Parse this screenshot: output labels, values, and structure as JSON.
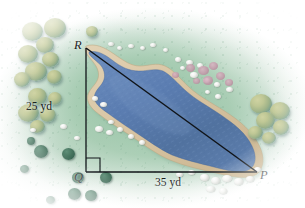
{
  "figure": {
    "type": "geometry-illustration",
    "labels": {
      "vertex_r": "R",
      "vertex_q": "Q",
      "vertex_p": "P",
      "leg_vertical": "25 yd",
      "leg_horizontal": "35 yd"
    },
    "geometry": {
      "right_angle_at": "Q",
      "vertices": {
        "R": {
          "x": 86,
          "y": 48
        },
        "Q": {
          "x": 86,
          "y": 172
        },
        "P": {
          "x": 257,
          "y": 172
        }
      },
      "leg_vertical_length": "25 yd",
      "leg_horizontal_length": "35 yd",
      "hypotenuse": "RP"
    },
    "colors": {
      "water": "#5d7fb4",
      "water_deep": "#44659d",
      "shore_sand": "#d9c6a6",
      "grass": "#96c3a5",
      "tree_canopy": "#bfc795",
      "tree_shade": "#4f8183",
      "bush": "#376css",
      "bush_dark": "#2f5a4a",
      "rock": "#eceee9",
      "flower": "#c59aab",
      "line": "#101418",
      "background": "#ffffff"
    },
    "elements": {
      "pond_label": "pond",
      "trees_label": "trees",
      "bushes_label": "bushes",
      "rocks_label": "rocks",
      "flowers_label": "flowering plants",
      "shoreline_label": "sandy shoreline"
    }
  }
}
